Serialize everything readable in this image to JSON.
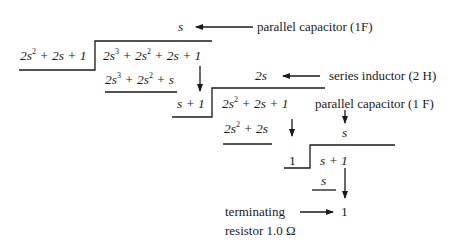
{
  "step1": {
    "quotient": "s",
    "quotient_label": "parallel capacitor (1F)",
    "divisor": [
      "2s",
      "2",
      " + 2s + 1"
    ],
    "dividend": [
      "2s",
      "3",
      " + 2s",
      "2",
      " + 2s + 1"
    ],
    "subtrahend": [
      "2s",
      "3",
      " + 2s",
      "2",
      " + s"
    ]
  },
  "step2": {
    "quotient": "2s",
    "quotient_label": "series inductor (2 H)",
    "divisor": "s + 1",
    "dividend": [
      "2s",
      "2",
      " + 2s + 1"
    ],
    "subtrahend": [
      "2s",
      "2",
      " + 2s"
    ]
  },
  "step3": {
    "quotient": "s",
    "quotient_label": "parallel capacitor (1 F)",
    "divisor": "1",
    "dividend": "s + 1",
    "subtrahend": "s"
  },
  "step4": {
    "quotient": "1",
    "quotient_label_line1": "terminating",
    "quotient_label_line2": "resistor 1.0 Ω"
  },
  "colors": {
    "ink": "#1a1a1a",
    "background": "#ffffff"
  }
}
